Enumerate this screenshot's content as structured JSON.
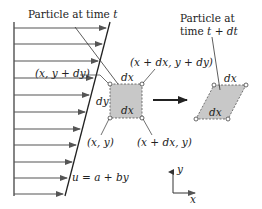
{
  "diagram": {
    "labels": {
      "particle_t_prefix": "Particle at time ",
      "particle_t_var": "t",
      "particle_tdt_line1": "Particle at",
      "particle_tdt_line2_prefix": "time ",
      "particle_tdt_line2_var": "t + dt",
      "corner_top_left": "(x, y + dy)",
      "corner_top_right": "(x + dx, y + dy)",
      "corner_bottom_left": "(x, y)",
      "corner_bottom_right": "(x + dx, y)",
      "square_top_side": "dx",
      "square_bottom_side": "dx",
      "square_left_side": "dy",
      "parallelogram_top_side": "dx",
      "parallelogram_bottom_side": "dx",
      "velocity_profile": "u = a + by",
      "axis_y": "y",
      "axis_x": "x"
    },
    "colors": {
      "element_fill": "#c8c8c8",
      "line": "#333333",
      "arrow": "#555555"
    },
    "velocity_arrows_y": [
      28,
      44,
      61,
      78,
      95,
      112,
      129,
      145,
      162,
      178,
      194
    ]
  }
}
